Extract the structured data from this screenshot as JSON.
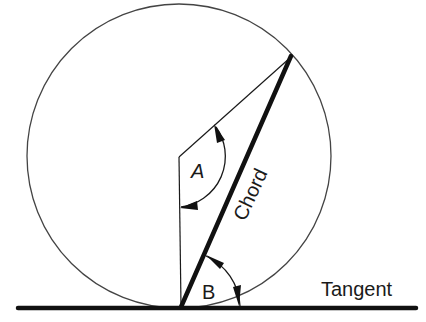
{
  "diagram": {
    "labels": {
      "angle_a": "A",
      "angle_b": "B",
      "chord": "Chord",
      "tangent": "Tangent"
    },
    "colors": {
      "stroke": "#1a1a1a",
      "circle": "#444444",
      "background": "#ffffff"
    },
    "geometry": {
      "circle_center": [
        179,
        156
      ],
      "circle_radius": 152,
      "tangent_point": [
        181,
        307
      ],
      "chord_end": [
        291,
        56
      ],
      "tangent_line_y": 307
    }
  }
}
